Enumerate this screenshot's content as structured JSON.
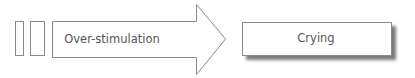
{
  "diagram": {
    "arrow_label": "Over-stimulation",
    "box_label": "Crying",
    "stroke_color": "#8a8a8a",
    "text_color": "#555555"
  }
}
